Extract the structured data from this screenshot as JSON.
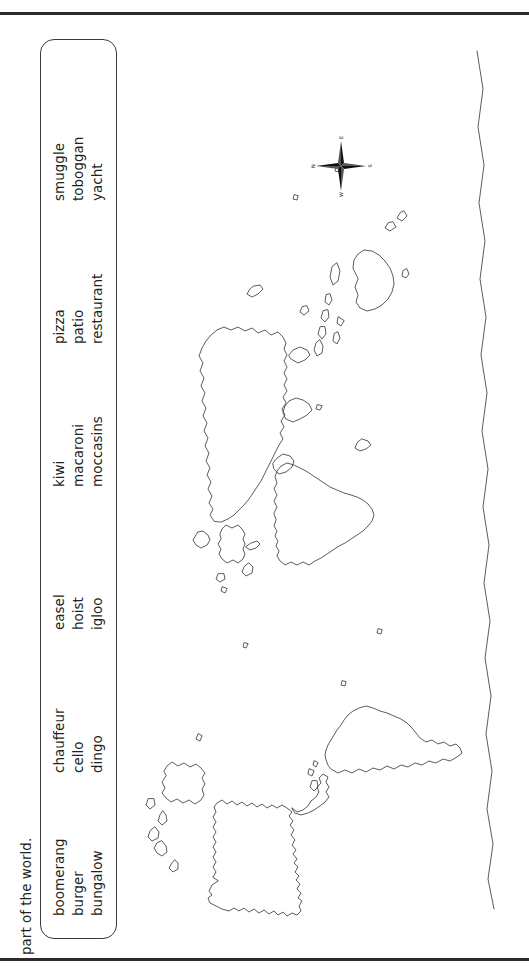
{
  "page": {
    "orientation": "landscape-rotated",
    "background_color": "#ffffff",
    "ink_color": "#231f20",
    "stroke_color": "#3f3f3f"
  },
  "instruction": {
    "text": "part of the world."
  },
  "word_bank": {
    "groups": [
      {
        "words": [
          "boomerang",
          "burger",
          "bungalow"
        ]
      },
      {
        "words": [
          "chauffeur",
          "cello",
          "dingo"
        ]
      },
      {
        "words": [
          "easel",
          "hoist",
          "igloo"
        ]
      },
      {
        "words": [
          "kiwi",
          "macaroni",
          "moccasins"
        ]
      },
      {
        "words": [
          "pizza",
          "patio",
          "restaurant"
        ]
      },
      {
        "words": [
          "smuggle",
          "toboggan",
          "yacht"
        ]
      }
    ]
  },
  "map": {
    "title": "blank outline world map",
    "fill": "none"
  },
  "compass": {
    "north": "N",
    "east": "E",
    "south": "S",
    "west": "W"
  }
}
